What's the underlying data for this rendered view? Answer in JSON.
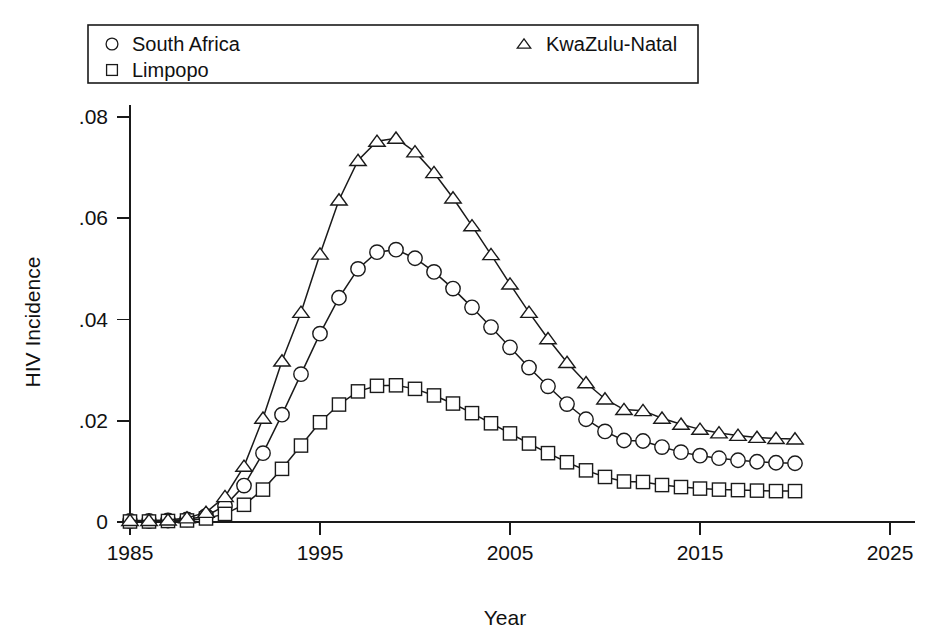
{
  "chart_data": {
    "type": "line",
    "title": "",
    "xlabel": "Year",
    "ylabel": "HIV Incidence",
    "xlim": [
      1985,
      2026
    ],
    "ylim": [
      0,
      0.085
    ],
    "xticks": [
      1985,
      1995,
      2005,
      2015,
      2025
    ],
    "xtick_labels": [
      "1985",
      "1995",
      "2005",
      "2015",
      "2025"
    ],
    "yticks": [
      0,
      0.02,
      0.04,
      0.06,
      0.08
    ],
    "ytick_labels": [
      "0",
      ".02",
      ".04",
      ".06",
      ".08"
    ],
    "grid": false,
    "legend_position": "top",
    "x": [
      1985,
      1986,
      1987,
      1988,
      1989,
      1990,
      1991,
      1992,
      1993,
      1994,
      1995,
      1996,
      1997,
      1998,
      1999,
      2000,
      2001,
      2002,
      2003,
      2004,
      2005,
      2006,
      2007,
      2008,
      2009,
      2010,
      2011,
      2012,
      2013,
      2014,
      2015,
      2016,
      2017,
      2018,
      2019,
      2020
    ],
    "series": [
      {
        "name": "South Africa",
        "marker": "circle",
        "values": [
          0.0002,
          0.0002,
          0.0003,
          0.0005,
          0.0012,
          0.0032,
          0.0072,
          0.0136,
          0.0212,
          0.0292,
          0.0372,
          0.0443,
          0.05,
          0.0533,
          0.0538,
          0.0521,
          0.0494,
          0.0461,
          0.0424,
          0.0385,
          0.0345,
          0.0305,
          0.0268,
          0.0233,
          0.0203,
          0.0179,
          0.0161,
          0.016,
          0.0148,
          0.0138,
          0.0131,
          0.0126,
          0.0122,
          0.0119,
          0.0117,
          0.0116
        ]
      },
      {
        "name": "Limpopo",
        "marker": "square",
        "values": [
          0.0001,
          0.0001,
          0.0002,
          0.0003,
          0.0007,
          0.0016,
          0.0034,
          0.0064,
          0.0105,
          0.0151,
          0.0197,
          0.0232,
          0.0258,
          0.0269,
          0.027,
          0.0263,
          0.025,
          0.0234,
          0.0215,
          0.0195,
          0.0175,
          0.0155,
          0.0136,
          0.0118,
          0.0102,
          0.0089,
          0.008,
          0.0079,
          0.0073,
          0.0069,
          0.0066,
          0.0064,
          0.0063,
          0.0062,
          0.0061,
          0.0061
        ]
      },
      {
        "name": "KwaZulu-Natal",
        "marker": "triangle",
        "values": [
          0.0003,
          0.0003,
          0.0004,
          0.0008,
          0.0019,
          0.005,
          0.011,
          0.0205,
          0.0318,
          0.0414,
          0.0529,
          0.0636,
          0.0714,
          0.0752,
          0.0758,
          0.0731,
          0.069,
          0.064,
          0.0585,
          0.0528,
          0.047,
          0.0414,
          0.0362,
          0.0315,
          0.0275,
          0.0243,
          0.0222,
          0.022,
          0.0205,
          0.0193,
          0.0183,
          0.0176,
          0.0171,
          0.0167,
          0.0165,
          0.0164
        ]
      }
    ]
  },
  "legend": {
    "entries": [
      {
        "label": "South Africa",
        "marker": "circle"
      },
      {
        "label": "Limpopo",
        "marker": "square"
      },
      {
        "label": "KwaZulu-Natal",
        "marker": "triangle"
      }
    ]
  },
  "colors": {
    "ink": "#1a1a1a",
    "background": "#ffffff",
    "marker_fill": "#ffffff"
  }
}
